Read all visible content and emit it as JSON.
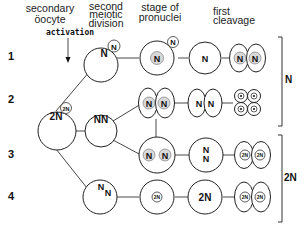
{
  "headers": {
    "col1": [
      "secondary",
      "öocyte"
    ],
    "col2": [
      "second",
      "meiotic",
      "division"
    ],
    "col3": [
      "stage of",
      "pronuclei"
    ],
    "col4": [
      "first",
      "cleavage"
    ]
  },
  "activation_label": "activation",
  "rows": [
    {
      "label": "1"
    },
    {
      "label": "2"
    },
    {
      "label": "3"
    },
    {
      "label": "4"
    }
  ],
  "nuclei": {
    "oocyte": "2N",
    "oocyte_polar": "2N",
    "row1_division": "N",
    "row1_polar": "N",
    "row1_pronucleus": "N",
    "row1_pronucleus_polar": "N",
    "row1_syngamy": "N",
    "row1_cleavage": [
      "N",
      "N"
    ],
    "row2_division": "NN",
    "row2_pronuclei": [
      "N",
      "N"
    ],
    "row2_syngamy": [
      "N",
      "N"
    ],
    "row3_pronuclei": [
      "N",
      "N"
    ],
    "row3_syngamy": [
      "N",
      "N"
    ],
    "row3_cleavage": [
      "2N",
      "2N"
    ],
    "row4_division": [
      "N",
      "N"
    ],
    "row4_pronucleus": "2N",
    "row4_syngamy": "2N",
    "row4_cleavage": [
      "2N",
      "2N"
    ]
  },
  "ploidy_brackets": [
    {
      "label": "N",
      "rows": "1-2"
    },
    {
      "label": "2N",
      "rows": "3-4"
    }
  ]
}
